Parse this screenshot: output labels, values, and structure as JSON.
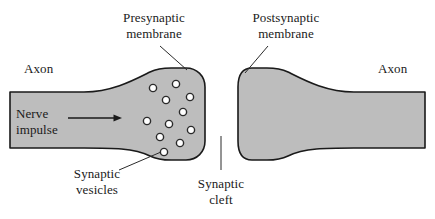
{
  "figure": {
    "colors": {
      "cell_fill": "#bdbdbd",
      "cell_outline": "#1a1a1a",
      "vesicle_fill": "#ffffff",
      "vesicle_outline": "#2b2b2b",
      "text": "#1a1a1a",
      "background": "#ffffff",
      "leader_line": "#2b2b2b"
    }
  },
  "labels": {
    "presynaptic_membrane_line1": "Presynaptic",
    "presynaptic_membrane_line2": "membrane",
    "postsynaptic_membrane_line1": "Postsynaptic",
    "postsynaptic_membrane_line2": "membrane",
    "axon_left": "Axon",
    "axon_right": "Axon",
    "nerve_impulse_line1": "Nerve",
    "nerve_impulse_line2": "impulse",
    "synaptic_vesicles_line1": "Synaptic",
    "synaptic_vesicles_line2": "vesicles",
    "synaptic_cleft_line1": "Synaptic",
    "synaptic_cleft_line2": "cleft"
  },
  "diagram_data": {
    "type": "biological-illustration",
    "subject": "chemical synapse between two neurons",
    "structures": [
      {
        "name": "presynaptic-neuron",
        "side": "left",
        "description": "axon narrowing at left, flaring into a bulbous synaptic terminal on the right",
        "axon_x_start": 10,
        "axon_x_end": 86,
        "axon_y_top": 92,
        "axon_y_bottom": 148,
        "terminal_x_end": 205,
        "terminal_y_top": 68,
        "terminal_y_bottom": 160
      },
      {
        "name": "postsynaptic-neuron",
        "side": "right",
        "description": "bulbous terminal on the left narrowing into an axon extending right",
        "terminal_x_start": 238,
        "terminal_y_top": 68,
        "terminal_y_bottom": 160,
        "axon_x_start": 352,
        "axon_x_end": 425,
        "axon_y_top": 92,
        "axon_y_bottom": 148
      },
      {
        "name": "synaptic-cleft",
        "description": "gap between the two membranes",
        "x_start": 205,
        "x_end": 238
      }
    ],
    "vesicle_count": 11,
    "vesicle_radius": 3.6,
    "vesicles": [
      {
        "cx": 153,
        "cy": 88
      },
      {
        "cx": 176,
        "cy": 84
      },
      {
        "cx": 190,
        "cy": 97
      },
      {
        "cx": 166,
        "cy": 100
      },
      {
        "cx": 183,
        "cy": 112
      },
      {
        "cx": 147,
        "cy": 121
      },
      {
        "cx": 169,
        "cy": 124
      },
      {
        "cx": 191,
        "cy": 130
      },
      {
        "cx": 160,
        "cy": 137
      },
      {
        "cx": 180,
        "cy": 143
      },
      {
        "cx": 164,
        "cy": 152
      }
    ],
    "impulse_arrow": {
      "x_start": 68,
      "x_end": 122,
      "y": 118,
      "direction": "right"
    },
    "leader_lines": [
      {
        "name": "presynaptic-membrane-leader",
        "x1": 160,
        "y1": 46,
        "x2": 186,
        "y2": 70
      },
      {
        "name": "postsynaptic-membrane-leader",
        "x1": 268,
        "y1": 46,
        "x2": 246,
        "y2": 72
      },
      {
        "name": "synaptic-vesicles-leader",
        "x1": 120,
        "y1": 170,
        "x2": 161,
        "y2": 152
      },
      {
        "name": "synaptic-cleft-leader",
        "x1": 221,
        "y1": 136,
        "x2": 221,
        "y2": 170
      }
    ]
  }
}
